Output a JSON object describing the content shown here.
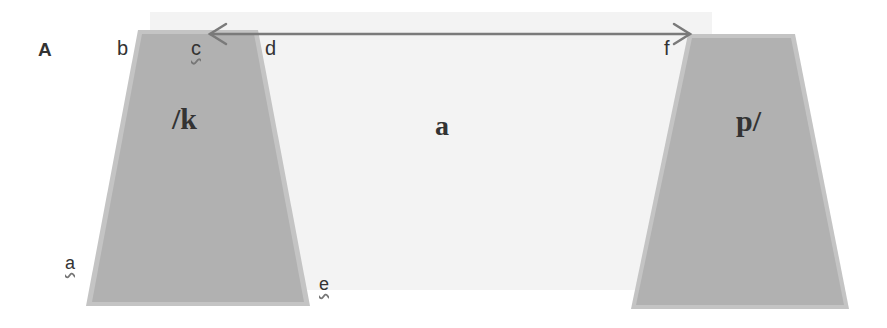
{
  "figure": {
    "panel_label": "A",
    "corner_labels": {
      "b": "b",
      "c": "c",
      "d": "d",
      "f": "f",
      "a": "a",
      "e": "e"
    },
    "left_block_label": "/k",
    "right_block_label": "p/",
    "gap_label": "a",
    "arrow": {
      "type": "double-headed",
      "from": "c",
      "to": "f"
    }
  },
  "colors": {
    "block_fill": "#b3b3b3",
    "block_edge": "#c6c6c6",
    "gap_fill": "#f2f2f2",
    "arrow": "#7a7a7a",
    "text": "#333333"
  }
}
